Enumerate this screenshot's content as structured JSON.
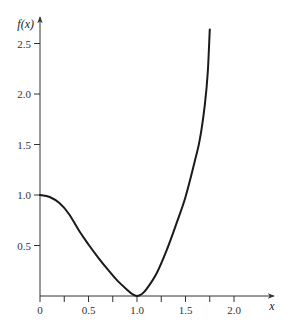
{
  "chart_data": {
    "type": "line",
    "title": "",
    "xlabel": "x",
    "ylabel": "f(x)",
    "xlim": [
      0,
      2.4
    ],
    "ylim": [
      0,
      2.7
    ],
    "grid": false,
    "legend": null,
    "x_ticks": [
      {
        "value": 0,
        "label": "0"
      },
      {
        "value": 0.25,
        "label": ""
      },
      {
        "value": 0.5,
        "label": "0.5"
      },
      {
        "value": 0.75,
        "label": ""
      },
      {
        "value": 1.0,
        "label": "1.0"
      },
      {
        "value": 1.25,
        "label": ""
      },
      {
        "value": 1.5,
        "label": "1.5"
      },
      {
        "value": 1.75,
        "label": ""
      },
      {
        "value": 2.0,
        "label": "2.0"
      }
    ],
    "y_ticks": [
      {
        "value": 0.5,
        "label": "0.5"
      },
      {
        "value": 1.0,
        "label": "1.0"
      },
      {
        "value": 1.5,
        "label": "1.5"
      },
      {
        "value": 2.0,
        "label": "2.0"
      },
      {
        "value": 2.5,
        "label": "2.5"
      }
    ],
    "series": [
      {
        "name": "f(x)",
        "color": "#1a1a1a",
        "x": [
          0.0,
          0.1,
          0.2,
          0.3,
          0.4,
          0.5,
          0.6,
          0.7,
          0.8,
          0.9,
          0.95,
          1.0,
          1.05,
          1.1,
          1.2,
          1.3,
          1.4,
          1.5,
          1.6,
          1.65,
          1.7,
          1.73,
          1.75
        ],
        "y": [
          1.0,
          0.98,
          0.92,
          0.81,
          0.65,
          0.51,
          0.38,
          0.26,
          0.15,
          0.06,
          0.02,
          0.0,
          0.02,
          0.07,
          0.22,
          0.44,
          0.7,
          0.98,
          1.35,
          1.56,
          1.9,
          2.22,
          2.64
        ]
      }
    ]
  },
  "axes": {
    "x_label": "x",
    "y_label": "f(x)"
  }
}
